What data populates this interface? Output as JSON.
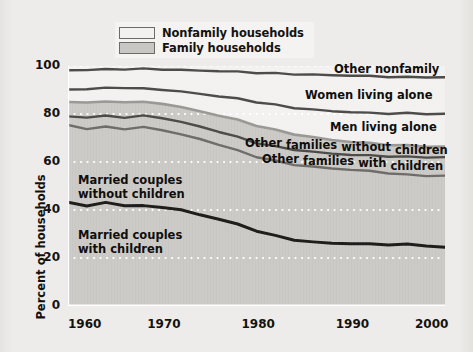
{
  "figure": {
    "y_axis_title": "Percent of households",
    "legend": [
      {
        "label": "Nonfamily households",
        "swatch": "#f2f1ef",
        "name": "legend-nonfamily"
      },
      {
        "label": "Family households",
        "swatch": "#c9c7c4",
        "name": "legend-family"
      }
    ],
    "yticks": [
      "100",
      "80",
      "60",
      "40",
      "20",
      "0"
    ],
    "xticks": [
      "1960",
      "1970",
      "1980",
      "1990",
      "2000"
    ],
    "annotations": [
      {
        "text": "Other nonfamily",
        "name": "label-other-nonfamily"
      },
      {
        "text": "Women living alone",
        "name": "label-women-living-alone"
      },
      {
        "text": "Men living alone",
        "name": "label-men-living-alone"
      },
      {
        "text": "Other families without children",
        "name": "label-other-families-without-children"
      },
      {
        "text": "Other families with children",
        "name": "label-other-families-with-children"
      },
      {
        "text": "Married couples without children",
        "name": "label-married-couples-without-children"
      },
      {
        "text": "Married couples with children",
        "name": "label-married-couples-with-children"
      }
    ]
  },
  "chart_data": {
    "type": "line",
    "title": "",
    "subtitle": "",
    "xlabel": "",
    "ylabel": "Percent of households",
    "xlim": [
      1960,
      2000
    ],
    "ylim": [
      0,
      100
    ],
    "ytick_values": [
      0,
      20,
      40,
      60,
      80,
      100
    ],
    "xtick_values": [
      1960,
      1970,
      1980,
      1990,
      2000
    ],
    "grid": "horizontal-dotted-white",
    "legend_position": "top-center",
    "note": "Cumulative stacked boundary lines; each series value is the cumulative top edge of its band.",
    "x": [
      1960,
      1962,
      1964,
      1966,
      1968,
      1970,
      1972,
      1974,
      1976,
      1978,
      1980,
      1982,
      1984,
      1986,
      1988,
      1990,
      1992,
      1994,
      1996,
      1998,
      2000
    ],
    "series": [
      {
        "name": "Other nonfamily",
        "color": "#4e4c49",
        "values": [
          98.2,
          98.4,
          98.6,
          98.7,
          98.8,
          98.6,
          98.3,
          98.1,
          97.9,
          97.6,
          97.2,
          96.9,
          96.6,
          96.4,
          96.2,
          96.0,
          95.8,
          95.5,
          95.3,
          95.4,
          95.2
        ]
      },
      {
        "name": "Women living alone",
        "color": "#4e4c49",
        "values": [
          90.2,
          90.4,
          90.8,
          91.0,
          90.5,
          90.2,
          89.3,
          88.4,
          87.4,
          86.4,
          85.0,
          83.8,
          82.6,
          81.8,
          81.2,
          80.8,
          80.4,
          80.2,
          80.3,
          80.1,
          80.0
        ]
      },
      {
        "name": "Men living alone",
        "color": "#9b9996",
        "values": [
          85.0,
          84.9,
          85.0,
          85.1,
          84.9,
          84.4,
          82.8,
          81.2,
          79.4,
          77.5,
          75.2,
          73.3,
          71.6,
          70.3,
          69.2,
          68.4,
          67.8,
          67.2,
          66.8,
          66.5,
          66.3
        ]
      },
      {
        "name": "Other families without children",
        "color": "#4e4c49",
        "values": [
          79.0,
          78.6,
          79.2,
          78.6,
          79.2,
          78.4,
          76.6,
          74.8,
          72.6,
          70.4,
          68.0,
          66.4,
          65.2,
          64.2,
          63.5,
          63.0,
          62.7,
          62.4,
          62.1,
          62.0,
          61.9
        ]
      },
      {
        "name": "Other families with children",
        "color": "#6f6d6a",
        "values": [
          75.4,
          73.8,
          74.6,
          73.8,
          74.4,
          73.4,
          71.4,
          69.6,
          67.2,
          64.8,
          62.2,
          60.4,
          58.9,
          58.0,
          57.3,
          56.8,
          56.2,
          55.4,
          54.6,
          54.3,
          54.2
        ]
      },
      {
        "name": "Married couples with children",
        "color": "#201e1c",
        "values": [
          43.2,
          41.8,
          43.0,
          42.0,
          41.6,
          41.2,
          40.0,
          38.0,
          36.2,
          34.0,
          31.4,
          29.2,
          27.6,
          26.6,
          26.2,
          26.0,
          25.8,
          25.6,
          25.6,
          25.2,
          24.3
        ]
      }
    ],
    "bands": [
      {
        "name": "Other nonfamily",
        "region": "nonfamily"
      },
      {
        "name": "Women living alone",
        "region": "nonfamily"
      },
      {
        "name": "Men living alone",
        "region": "nonfamily"
      },
      {
        "name": "Other families without children",
        "region": "family"
      },
      {
        "name": "Other families with children",
        "region": "family"
      },
      {
        "name": "Married couples without children",
        "region": "family"
      },
      {
        "name": "Married couples with children",
        "region": "family"
      }
    ]
  }
}
